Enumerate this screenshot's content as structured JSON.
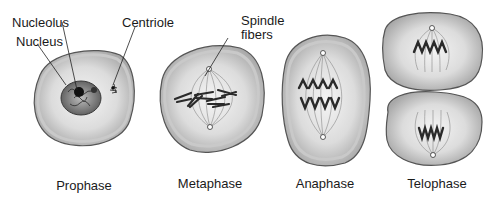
{
  "diagram": {
    "stages": [
      {
        "id": "prophase",
        "caption": "Prophase"
      },
      {
        "id": "metaphase",
        "caption": "Metaphase"
      },
      {
        "id": "anaphase",
        "caption": "Anaphase"
      },
      {
        "id": "telophase",
        "caption": "Telophase"
      }
    ],
    "labels": {
      "nucleolus": "Nucleolus",
      "nucleus": "Nucleus",
      "centriole": "Centriole",
      "spindle_line1": "Spindle",
      "spindle_line2": "fibers"
    },
    "colors": {
      "cell_fill": "#b8b8b8",
      "cell_inner": "#e8e8e8",
      "cell_outline": "#555555",
      "nucleus_fill": "#6e6e6e",
      "chromosome": "#2a2a2a",
      "text": "#1a1a1a"
    }
  }
}
